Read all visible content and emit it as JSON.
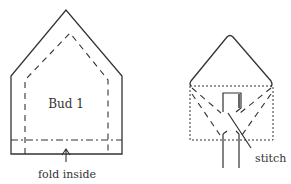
{
  "diagram": {
    "left": {
      "label": "Bud 1",
      "caption": "fold inside"
    },
    "right": {
      "caption": "stitch"
    },
    "colors": {
      "line": "#333333",
      "background": "#ffffff"
    }
  }
}
